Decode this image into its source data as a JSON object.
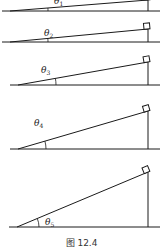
{
  "figure": {
    "caption": "图 12.4",
    "line_color": "#1a1a1a",
    "panels": [
      {
        "label": "θ",
        "sub": "1",
        "base_y": 11,
        "top_y": 0,
        "left_x": 10,
        "right_x": 148,
        "label_x": 54,
        "label_y": 4
      },
      {
        "label": "θ",
        "sub": "2",
        "base_y": 42,
        "top_y": 29,
        "left_x": 10,
        "right_x": 148,
        "label_x": 44,
        "label_y": 36
      },
      {
        "label": "θ",
        "sub": "3",
        "base_y": 85,
        "top_y": 62,
        "left_x": 18,
        "right_x": 148,
        "label_x": 41,
        "label_y": 73
      },
      {
        "label": "θ",
        "sub": "4",
        "base_y": 149,
        "top_y": 111,
        "left_x": 18,
        "right_x": 148,
        "label_x": 34,
        "label_y": 126
      },
      {
        "label": "θ",
        "sub": "5",
        "base_y": 227,
        "top_y": 172,
        "left_x": 17,
        "right_x": 148,
        "label_x": 45,
        "label_y": 225
      }
    ]
  }
}
